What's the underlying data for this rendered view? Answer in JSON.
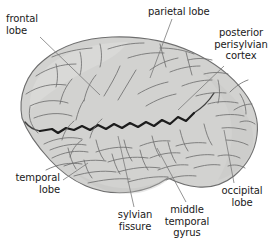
{
  "figure": {
    "background_color": "#ffffff",
    "brain_fill_color": "#d2d2d0",
    "brain_outline_color": "#6e6e6e",
    "sulci_color": "#707070",
    "sylvian_fissure_color": "#1c1c1c",
    "label_text_color": "#1a1a1a",
    "leader_line_color": "#7a7a7a"
  },
  "labels": [
    {
      "id": "frontal",
      "text": "frontal\nlobe",
      "align": "left",
      "leader": {
        "from_x": 40,
        "from_y": 37,
        "to_x": 100,
        "to_y": 95
      }
    },
    {
      "id": "parietal",
      "text": "parietal lobe",
      "align": "left",
      "leader": {
        "from_x": 172,
        "from_y": 19,
        "to_x": 150,
        "to_y": 78
      }
    },
    {
      "id": "posterior",
      "text": "posterior\nperisylvian\ncortex",
      "align": "center",
      "leader": {
        "from_x": 224,
        "from_y": 66,
        "to_x": 178,
        "to_y": 110
      }
    },
    {
      "id": "temporal",
      "text": "temporal\nlobe",
      "align": "right",
      "leader": {
        "from_x": 63,
        "from_y": 180,
        "to_x": 88,
        "to_y": 163
      }
    },
    {
      "id": "sylvian",
      "text": "sylvian\nfissure",
      "align": "center",
      "leader": {
        "from_x": 134,
        "from_y": 207,
        "to_x": 118,
        "to_y": 136
      }
    },
    {
      "id": "middletemporal",
      "text": "middle\ntemporal\ngyrus",
      "align": "center",
      "leader": {
        "from_x": 186,
        "from_y": 202,
        "to_x": 157,
        "to_y": 148
      }
    },
    {
      "id": "occipital",
      "text": "occipital\nlobe",
      "align": "center",
      "leader": {
        "from_x": 234,
        "from_y": 183,
        "to_x": 224,
        "to_y": 130
      }
    }
  ]
}
